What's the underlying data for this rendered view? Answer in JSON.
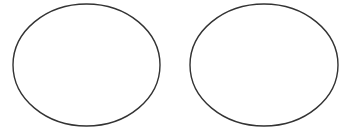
{
  "canvas": {
    "width": 348,
    "height": 134,
    "background": "#ffffff"
  },
  "shapes": [
    {
      "type": "ellipse",
      "label": "left-ellipse",
      "cx": 86.5,
      "cy": 65,
      "rx": 73.5,
      "ry": 61,
      "stroke": "#333333",
      "stroke_width": 1.4,
      "fill": "none"
    },
    {
      "type": "ellipse",
      "label": "right-ellipse",
      "cx": 264,
      "cy": 65,
      "rx": 74,
      "ry": 61,
      "stroke": "#333333",
      "stroke_width": 1.4,
      "fill": "none"
    }
  ]
}
